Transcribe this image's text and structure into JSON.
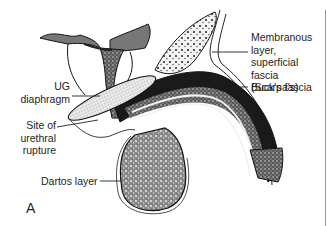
{
  "figure": {
    "panel_letter": "A",
    "labels": {
      "membranous": [
        "Membranous",
        "layer,",
        "superficial",
        "fascia",
        "(Scarpa's)"
      ],
      "bucks": "Buck's fascia",
      "ug": [
        "UG",
        "diaphragm"
      ],
      "rupture": [
        "Site of",
        "urethral",
        "rupture"
      ],
      "dartos": "Dartos layer"
    }
  }
}
